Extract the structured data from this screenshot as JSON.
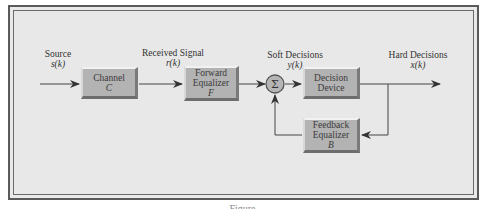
{
  "diagram": {
    "colors": {
      "background": "#e8e8e8",
      "block_fill": "#b3b3b3",
      "line": "#444444",
      "frame": "#5a5a5a"
    },
    "signals": {
      "source": {
        "label": "Source",
        "var": "s(k)"
      },
      "received": {
        "label": "Received Signal",
        "var": "r(k)"
      },
      "soft": {
        "label": "Soft Decisions",
        "var": "y(k)"
      },
      "hard": {
        "label": "Hard Decisions",
        "var": "x(k)"
      }
    },
    "blocks": {
      "channel": {
        "line1": "Channel",
        "var": "C"
      },
      "forward": {
        "line1": "Forward",
        "line2": "Equalizer",
        "var": "F"
      },
      "sum": {
        "symbol": "Σ"
      },
      "decision": {
        "line1": "Decision",
        "line2": "Device"
      },
      "feedback": {
        "line1": "Feedback",
        "line2": "Equalizer",
        "var": "B"
      }
    },
    "edges": [
      {
        "from": "source",
        "to": "channel"
      },
      {
        "from": "channel",
        "to": "forward"
      },
      {
        "from": "forward",
        "to": "sum"
      },
      {
        "from": "sum",
        "to": "decision"
      },
      {
        "from": "decision",
        "to": "output"
      },
      {
        "from": "decision",
        "to": "feedback"
      },
      {
        "from": "feedback",
        "to": "sum"
      }
    ],
    "caption": "Figure"
  }
}
